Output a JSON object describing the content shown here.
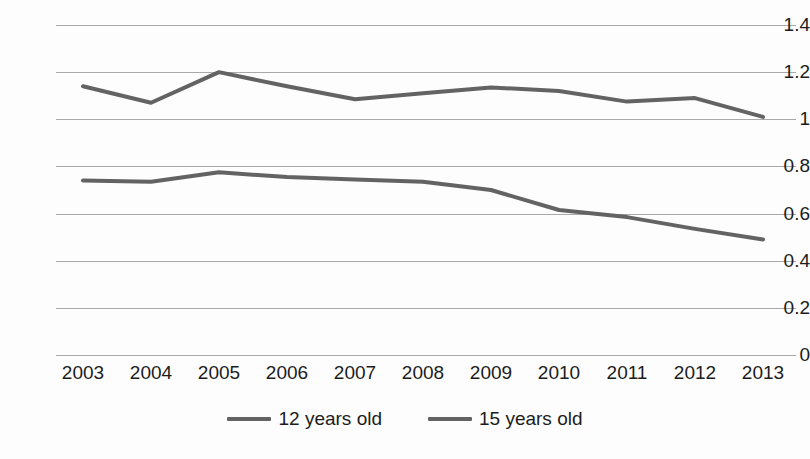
{
  "chart_data": {
    "type": "line",
    "title": "",
    "subtitle": "",
    "xlabel": "",
    "ylabel": "",
    "categories": [
      "2003",
      "2004",
      "2005",
      "2006",
      "2007",
      "2008",
      "2009",
      "2010",
      "2011",
      "2012",
      "2013"
    ],
    "series": [
      {
        "name": "12 years old",
        "color": "#636363",
        "values": [
          0.74,
          0.735,
          0.775,
          0.755,
          0.745,
          0.735,
          0.7,
          0.615,
          0.585,
          0.535,
          0.49
        ]
      },
      {
        "name": "15 years old",
        "color": "#636363",
        "values": [
          1.14,
          1.07,
          1.2,
          1.14,
          1.085,
          1.11,
          1.135,
          1.12,
          1.075,
          1.09,
          1.01
        ]
      }
    ],
    "ylim": [
      0,
      1.4
    ],
    "ytick_labels": [
      "0",
      "0.2",
      "0.4",
      "0.6",
      "0.8",
      "1",
      "1.2",
      "1.4"
    ],
    "ytick_values": [
      0,
      0.2,
      0.4,
      0.6,
      0.8,
      1.0,
      1.2,
      1.4
    ],
    "grid": true,
    "grid_color": "#a9a9a9",
    "legend_position": "bottom",
    "background_color": "#fdfdfd",
    "line_width": 4
  },
  "legend": {
    "entries": [
      {
        "label": "12 years old",
        "swatch_name": "legend-swatch-12-years-old"
      },
      {
        "label": "15 years old",
        "swatch_name": "legend-swatch-15-years-old"
      }
    ]
  }
}
